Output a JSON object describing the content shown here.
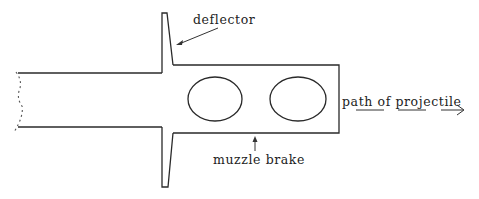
{
  "diagram": {
    "labels": {
      "deflector": "deflector",
      "muzzle_brake": "muzzle brake",
      "path": "path of projectile"
    },
    "components": [
      {
        "name": "barrel",
        "description": "gun barrel with broken (cut) left end"
      },
      {
        "name": "deflector",
        "description": "flange projecting above and below barrel with slanted inner face"
      },
      {
        "name": "muzzle-brake",
        "description": "rectangular brake body with two elliptical ports"
      },
      {
        "name": "port-left",
        "description": "left elliptical port"
      },
      {
        "name": "port-right",
        "description": "right elliptical port"
      },
      {
        "name": "projectile-path",
        "description": "dashed line with arrowhead pointing right"
      }
    ],
    "colors": {
      "stroke": "#2a2a2a",
      "background": "#ffffff"
    }
  }
}
